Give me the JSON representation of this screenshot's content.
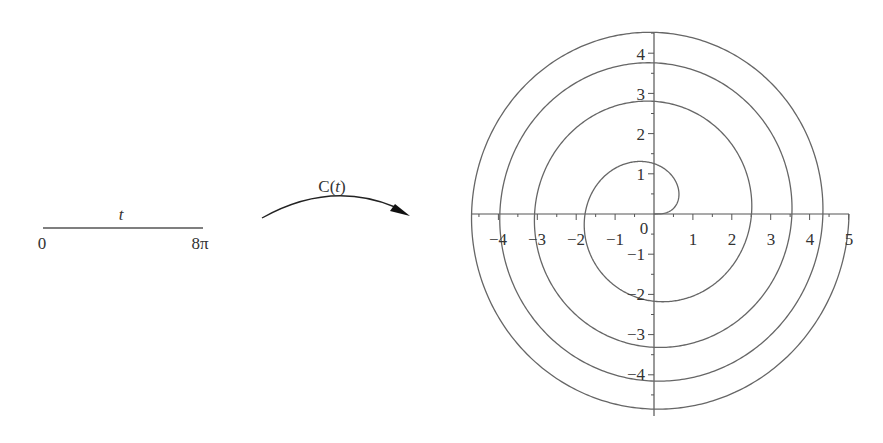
{
  "domain_interval": {
    "variable_label": "t",
    "start_label": "0",
    "end_label": "8π",
    "range": [
      0,
      25.1327
    ]
  },
  "mapping": {
    "label_prefix": "C",
    "label_arg": "t",
    "label": "C(t)"
  },
  "plot": {
    "x_ticks": [
      "−4",
      "−3",
      "−2",
      "−1",
      "1",
      "2",
      "3",
      "4",
      "5"
    ],
    "y_ticks": [
      "4",
      "3",
      "2",
      "1",
      "−1",
      "−2",
      "−3",
      "−4"
    ],
    "origin_label": "0"
  },
  "chart_data": {
    "type": "line",
    "title": "",
    "xlabel": "",
    "ylabel": "",
    "xlim": [
      -4.7,
      5.0
    ],
    "ylim": [
      -4.9,
      4.6
    ],
    "grid": false,
    "x_ticks": [
      -4,
      -3,
      -2,
      -1,
      0,
      1,
      2,
      3,
      4,
      5
    ],
    "y_ticks": [
      -4,
      -3,
      -2,
      -1,
      0,
      1,
      2,
      3,
      4
    ],
    "series": [
      {
        "name": "C(t)",
        "t_range": [
          0,
          25.1327
        ],
        "axis_crossings": [
          {
            "t": "π/2",
            "x": 0,
            "y": 1.25
          },
          {
            "t": "π",
            "x": -1.77,
            "y": 0
          },
          {
            "t": "3π/2",
            "x": 0,
            "y": -2.17
          },
          {
            "t": "2π",
            "x": 2.51,
            "y": 0
          },
          {
            "t": "5π/2",
            "x": 0,
            "y": 2.8
          },
          {
            "t": "3π",
            "x": -3.07,
            "y": 0
          },
          {
            "t": "7π/2",
            "x": 0,
            "y": -3.32
          },
          {
            "t": "4π",
            "x": 3.54,
            "y": 0
          },
          {
            "t": "9π/2",
            "x": 0,
            "y": 3.76
          },
          {
            "t": "5π",
            "x": -3.96,
            "y": 0
          },
          {
            "t": "11π/2",
            "x": 0,
            "y": -4.16
          },
          {
            "t": "6π",
            "x": 4.34,
            "y": 0
          },
          {
            "t": "13π/2",
            "x": 0,
            "y": 4.52
          },
          {
            "t": "7π",
            "x": -4.69,
            "y": 0
          },
          {
            "t": "15π/2",
            "x": 0,
            "y": -4.85
          },
          {
            "t": "8π",
            "x": 5.01,
            "y": 0
          }
        ]
      }
    ]
  }
}
